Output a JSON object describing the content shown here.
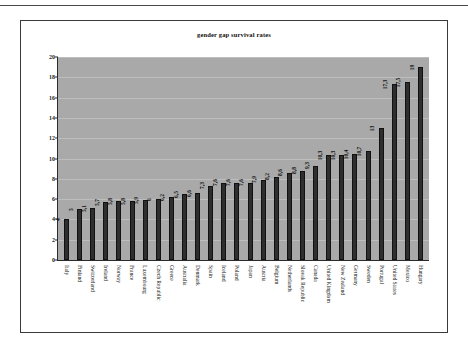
{
  "chart_data": {
    "type": "bar",
    "title": "gender gap survival rates",
    "xlabel": "",
    "ylabel": "",
    "ylim": [
      0,
      20
    ],
    "yticks": [
      0,
      2,
      4,
      6,
      8,
      10,
      12,
      14,
      16,
      18,
      20
    ],
    "grid": true,
    "legend": "none",
    "orientation": "vertical",
    "categories": [
      "Italy",
      "Finland",
      "Switzerland",
      "Ireland",
      "Norway",
      "France",
      "Luxembourg",
      "Czech Republic",
      "Greece",
      "Australia",
      "Denmark",
      "Spain",
      "Iceland",
      "Poland",
      "Japan",
      "Austria",
      "Belgium",
      "Netherlands",
      "Slovak Republic",
      "Canada",
      "United Kingdom",
      "New Zealand",
      "Germany",
      "Sweden",
      "Portugal",
      "United States",
      "Mexico",
      "Hungary"
    ],
    "values": [
      4,
      5,
      5.1,
      5.7,
      5.8,
      5.8,
      5.9,
      6,
      6.2,
      6.5,
      6.6,
      7.3,
      7.6,
      7.6,
      7.6,
      7.9,
      8.2,
      8.6,
      8.8,
      9.3,
      10.3,
      10.3,
      10.4,
      10.7,
      13,
      17.3,
      17.5,
      19
    ],
    "value_labels": [
      "4",
      "5",
      "5,1",
      "5,7",
      "5,8",
      "5,8",
      "5,9",
      "6",
      "6,2",
      "6,5",
      "6,6",
      "7,3",
      "7,6",
      "7,6",
      "7,6",
      "7,9",
      "8,2",
      "8,6",
      "8,8",
      "9,3",
      "10,3",
      "10,3",
      "10,4",
      "10,7",
      "13",
      "17,3",
      "17,5",
      "19"
    ],
    "colors": {
      "bar": "#2e2e2e",
      "plot_background": "#a9a9a9",
      "gridline": "#bdbdbd",
      "axis": "#2b2b2b",
      "frame": "#3a3a3a",
      "text": "#101010"
    }
  }
}
